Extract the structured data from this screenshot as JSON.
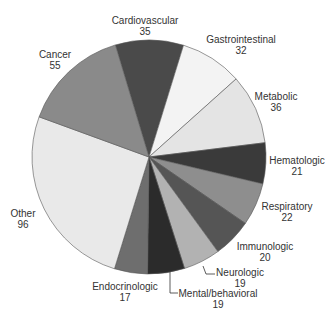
{
  "chart_data": {
    "type": "pie",
    "title": "",
    "start_angle_deg": 343.3,
    "direction": "clockwise",
    "total": 372,
    "categories": [
      "Cardiovascular",
      "Gastrointestinal",
      "Metabolic",
      "Hematologic",
      "Respiratory",
      "Immunologic",
      "Neurologic",
      "Mental/behavioral",
      "Endocrinologic",
      "Other",
      "Cancer"
    ],
    "values": [
      35,
      32,
      36,
      21,
      22,
      20,
      19,
      19,
      17,
      96,
      55
    ],
    "colors": [
      "#4a4a4a",
      "#f3f3f3",
      "#e4e4e4",
      "#3a3a3a",
      "#8e8e8e",
      "#555555",
      "#b2b2b2",
      "#2b2b2b",
      "#6e6e6e",
      "#e9e9e9",
      "#8a8a8a"
    ],
    "center": [
      149,
      157
    ],
    "radius": 117,
    "legend": "none (direct labels)",
    "labels": [
      {
        "name": "Cardiovascular",
        "value": "35",
        "x": 145,
        "y": 16
      },
      {
        "name": "Gastrointestinal",
        "value": "32",
        "x": 241,
        "y": 35
      },
      {
        "name": "Metabolic",
        "value": "36",
        "x": 276,
        "y": 92
      },
      {
        "name": "Hematologic",
        "value": "21",
        "x": 297,
        "y": 156
      },
      {
        "name": "Respiratory",
        "value": "22",
        "x": 287,
        "y": 202
      },
      {
        "name": "Immunologic",
        "value": "20",
        "x": 265,
        "y": 242
      },
      {
        "name": "Neurologic",
        "value": "19",
        "x": 240,
        "y": 268
      },
      {
        "name": "Mental/behavioral",
        "value": "19",
        "x": 218,
        "y": 289
      },
      {
        "name": "Endocrinologic",
        "value": "17",
        "x": 125,
        "y": 282
      },
      {
        "name": "Other",
        "value": "96",
        "x": 23,
        "y": 209
      },
      {
        "name": "Cancer",
        "value": "55",
        "x": 55,
        "y": 50
      }
    ],
    "leader_lines": [
      {
        "for": "Neurologic",
        "points": [
          [
            203,
            266
          ],
          [
            206,
            274
          ],
          [
            215,
            274
          ]
        ]
      },
      {
        "for": "Mental/behavioral",
        "points": [
          [
            170,
            272
          ],
          [
            170,
            293
          ],
          [
            178,
            293
          ]
        ]
      }
    ]
  }
}
